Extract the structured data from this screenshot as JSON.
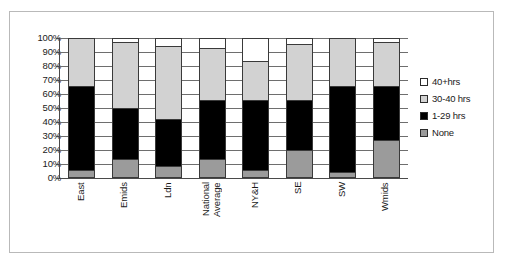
{
  "chart_data": {
    "type": "bar",
    "subtype": "100% stacked column",
    "title": "",
    "xlabel": "",
    "ylabel": "",
    "ylim": [
      0,
      100
    ],
    "yticks": [
      "0%",
      "10%",
      "20%",
      "30%",
      "40%",
      "50%",
      "60%",
      "70%",
      "80%",
      "90%",
      "100%"
    ],
    "grid": true,
    "legend_position": "right",
    "categories": [
      "East",
      "Emids",
      "Ldn",
      "National\nAverage",
      "NY&H",
      "SE",
      "SW",
      "Wmids"
    ],
    "series": [
      {
        "name": "None",
        "color": "#9b9b9b",
        "values": [
          4,
          12,
          7,
          12,
          4,
          19,
          3,
          26
        ]
      },
      {
        "name": "1-29 hrs",
        "color": "#000000",
        "values": [
          61,
          37,
          34,
          43,
          51,
          36,
          62,
          39
        ]
      },
      {
        "name": "30-40 hrs",
        "color": "#d2d2d2",
        "values": [
          35,
          48,
          53,
          38,
          28,
          41,
          35,
          32
        ]
      },
      {
        "name": "40+hrs",
        "color": "#ffffff",
        "values": [
          0,
          3,
          6,
          7,
          17,
          4,
          0,
          3
        ]
      }
    ]
  },
  "legend": {
    "items": [
      {
        "label": "40+hrs",
        "color": "#ffffff"
      },
      {
        "label": "30-40 hrs",
        "color": "#d2d2d2"
      },
      {
        "label": "1-29 hrs",
        "color": "#000000"
      },
      {
        "label": "None",
        "color": "#9b9b9b"
      }
    ]
  }
}
